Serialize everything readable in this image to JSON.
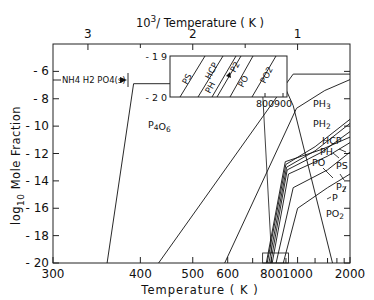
{
  "chart_data": {
    "type": "line",
    "title": "",
    "xlabel": "Temperature ( K )",
    "x2label": "10^3/ Temperature ( K )",
    "ylabel": "log10 Mole Fraction",
    "x_scale": "reciprocal (linear in 1000/T)",
    "xlim": [
      300,
      2000
    ],
    "ylim": [
      -20,
      -4
    ],
    "x_ticks": [
      300,
      400,
      500,
      600,
      800,
      1000,
      2000
    ],
    "x_minor_ticks": [
      700,
      900,
      1200,
      1400,
      1600,
      1800
    ],
    "x2_ticks": [
      3,
      2,
      1
    ],
    "x2_minor_ticks": [
      2.5,
      1.5
    ],
    "y_ticks": [
      -6,
      -8,
      -10,
      -12,
      -14,
      -16,
      -18,
      -20
    ],
    "grid": false,
    "annotations": [
      {
        "text": "NH4H2PO4(s)",
        "note": "stability range arrow from 300 K to ~385 K"
      }
    ],
    "series": [
      {
        "name": "P4O6",
        "points": [
          [
            355,
            -20
          ],
          [
            390,
            -6.9
          ],
          [
            880,
            -6.9
          ],
          [
            960,
            -8.5
          ],
          [
            1500,
            -20
          ]
        ]
      },
      {
        "name": "PH3",
        "points": [
          [
            430,
            -20
          ],
          [
            880,
            -7.2
          ],
          [
            960,
            -6.2
          ],
          [
            2000,
            -6.2
          ]
        ]
      },
      {
        "name": "PH2",
        "points": [
          [
            590,
            -20
          ],
          [
            990,
            -8.7
          ],
          [
            1350,
            -7.4
          ],
          [
            2000,
            -6.6
          ]
        ]
      },
      {
        "name": "HCP",
        "points": [
          [
            775,
            -20
          ],
          [
            900,
            -12.8
          ],
          [
            1200,
            -11.5
          ],
          [
            2000,
            -9.5
          ]
        ]
      },
      {
        "name": "PH",
        "points": [
          [
            785,
            -20
          ],
          [
            905,
            -13.0
          ],
          [
            1200,
            -11.8
          ],
          [
            2000,
            -9.8
          ]
        ]
      },
      {
        "name": "PO",
        "points": [
          [
            795,
            -20
          ],
          [
            910,
            -13.2
          ],
          [
            1300,
            -11.9
          ],
          [
            2000,
            -10.4
          ]
        ]
      },
      {
        "name": "PS",
        "points": [
          [
            770,
            -20
          ],
          [
            895,
            -12.6
          ],
          [
            1300,
            -11.7
          ],
          [
            2000,
            -10.8
          ]
        ]
      },
      {
        "name": "P2",
        "points": [
          [
            805,
            -20
          ],
          [
            920,
            -13.5
          ],
          [
            1400,
            -12.2
          ],
          [
            2000,
            -11.2
          ]
        ]
      },
      {
        "name": "P",
        "points": [
          [
            830,
            -20
          ],
          [
            960,
            -14.5
          ],
          [
            1400,
            -13.2
          ],
          [
            2000,
            -11.9
          ]
        ]
      },
      {
        "name": "PO2",
        "points": [
          [
            880,
            -20
          ],
          [
            1000,
            -16.0
          ],
          [
            1400,
            -14.5
          ],
          [
            2000,
            -13.5
          ]
        ]
      }
    ],
    "inset": {
      "xlim": [
        750,
        920
      ],
      "ylim": [
        -20,
        -19
      ],
      "x_ticks": [
        800,
        900
      ],
      "y_ticks": [
        -19,
        -20
      ],
      "series_order": [
        "PS",
        "PH",
        "HCP",
        "P2",
        "PO",
        "PO2"
      ]
    }
  },
  "labels": {
    "top_axis_title_base": "10",
    "top_axis_title_sup": "3",
    "top_axis_title_rest": "/ Temperature ( K )",
    "bottom_axis_title": "Temperature ( K )",
    "y_axis_title_log": "log",
    "y_axis_title_sub": "10",
    "y_axis_title_rest": " Mole Fraction",
    "annotation_nh4": "NH4 H2 PO4(s)"
  }
}
